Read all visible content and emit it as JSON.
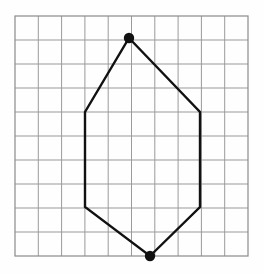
{
  "canvas": {
    "width": 264,
    "height": 274,
    "background_color": "#fefefe"
  },
  "grid": {
    "name": "graph-paper-grid",
    "x": 15,
    "y": 16,
    "width": 233,
    "height": 240,
    "columns": 10,
    "rows": 10,
    "cell_width": 23.3,
    "cell_height": 24.0,
    "line_color": "#9a9a9a",
    "line_width": 1,
    "border_color": "#8a8a8a",
    "border_width": 1.2
  },
  "chart_data": {
    "type": "scatter",
    "title": "",
    "xlabel": "",
    "ylabel": "",
    "grid": true,
    "legend_position": "none",
    "shape": {
      "name": "hexagon-house-polygon",
      "closed": true,
      "stroke_color": "#111111",
      "stroke_width": 2.4,
      "fill": "none",
      "vertices_px": [
        [
          129,
          38
        ],
        [
          200,
          112
        ],
        [
          200,
          207
        ],
        [
          150,
          256
        ],
        [
          85,
          207
        ],
        [
          85,
          112
        ]
      ],
      "vertices_grid": [
        [
          4.9,
          0.9
        ],
        [
          7.9,
          4.0
        ],
        [
          7.9,
          8.0
        ],
        [
          5.8,
          10.0
        ],
        [
          3.0,
          8.0
        ],
        [
          3.0,
          4.0
        ]
      ]
    },
    "marked_points": [
      {
        "name": "top-vertex-dot",
        "x_px": 129,
        "y_px": 38,
        "radius": 5.2,
        "color": "#111111",
        "label": ""
      },
      {
        "name": "bottom-vertex-dot",
        "x_px": 150,
        "y_px": 256,
        "radius": 5.2,
        "color": "#111111",
        "label": ""
      }
    ],
    "edges": [
      {
        "name": "top-left-slant",
        "from": [
          129,
          38
        ],
        "to": [
          85,
          112
        ]
      },
      {
        "name": "top-right-slant",
        "from": [
          129,
          38
        ],
        "to": [
          200,
          112
        ]
      },
      {
        "name": "rect-top-edge",
        "from": [
          85,
          112
        ],
        "to": [
          200,
          112
        ]
      },
      {
        "name": "rect-left-edge",
        "from": [
          85,
          112
        ],
        "to": [
          85,
          207
        ]
      },
      {
        "name": "rect-right-edge",
        "from": [
          200,
          112
        ],
        "to": [
          200,
          207
        ]
      },
      {
        "name": "rect-bottom-edge",
        "from": [
          85,
          207
        ],
        "to": [
          200,
          207
        ]
      },
      {
        "name": "bottom-left-slant",
        "from": [
          85,
          207
        ],
        "to": [
          150,
          256
        ]
      },
      {
        "name": "bottom-right-slant",
        "from": [
          200,
          207
        ],
        "to": [
          150,
          256
        ]
      }
    ]
  }
}
